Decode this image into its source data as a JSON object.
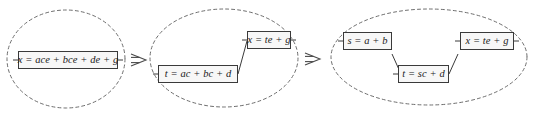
{
  "diagram": {
    "type": "dataflow-transformation-diagram",
    "colors": {
      "box_border": "#3a3a3a",
      "box_fill": "#f7f7f7",
      "ellipse_stroke": "#6e6e6e",
      "connector_stroke": "#3a3a3a",
      "arrow_stroke": "#4a4a4a",
      "text": "#1a1a1a",
      "background": "#ffffff"
    },
    "stages": [
      {
        "id": "stage-1",
        "index": 1,
        "boxes": [
          {
            "id": "stage1-box1",
            "equation": "x = ace + bce + de + g"
          }
        ]
      },
      {
        "id": "stage-2",
        "index": 2,
        "boxes": [
          {
            "id": "stage2-box1",
            "equation": "x = te + g"
          },
          {
            "id": "stage2-box2",
            "equation": "t = ac + bc + d"
          }
        ]
      },
      {
        "id": "stage-3",
        "index": 3,
        "boxes": [
          {
            "id": "stage3-box1",
            "equation": "s = a + b"
          },
          {
            "id": "stage3-box2",
            "equation": "t = sc + d"
          },
          {
            "id": "stage3-box3",
            "equation": "x = te + g"
          }
        ]
      }
    ],
    "arrows": [
      {
        "id": "arrow-1",
        "glyph": "double-arrow-right",
        "from": "stage-1",
        "to": "stage-2"
      },
      {
        "id": "arrow-2",
        "glyph": "double-arrow-right",
        "from": "stage-2",
        "to": "stage-3"
      }
    ]
  }
}
